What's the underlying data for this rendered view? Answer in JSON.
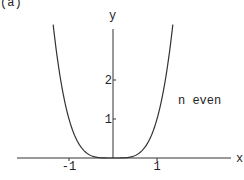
{
  "panel_label": "(a)",
  "chart_data": {
    "type": "line",
    "title": "",
    "xlabel": "x",
    "ylabel": "y",
    "annotation": "n even",
    "function": "y = x^n (n even, plotted with n = 4)",
    "xlim": [
      -2.1,
      2.6
    ],
    "ylim": [
      0,
      3.4
    ],
    "x_ticks": [
      -1,
      1
    ],
    "x_tick_labels": [
      "-1",
      "1"
    ],
    "y_ticks": [
      1,
      2
    ],
    "y_tick_labels": [
      "1",
      "2"
    ],
    "grid": false,
    "series": [
      {
        "name": "n even",
        "x": [
          -1.36,
          -1.2,
          -1.0,
          -0.8,
          -0.6,
          -0.4,
          -0.2,
          0,
          0.2,
          0.4,
          0.6,
          0.8,
          1.0,
          1.2,
          1.36
        ],
        "values": [
          3.42,
          2.07,
          1.0,
          0.41,
          0.13,
          0.03,
          0.0,
          0.0,
          0.0,
          0.03,
          0.13,
          0.41,
          1.0,
          2.07,
          3.42
        ]
      }
    ],
    "colors": {
      "axis": "#333333",
      "curve": "#333333"
    }
  }
}
